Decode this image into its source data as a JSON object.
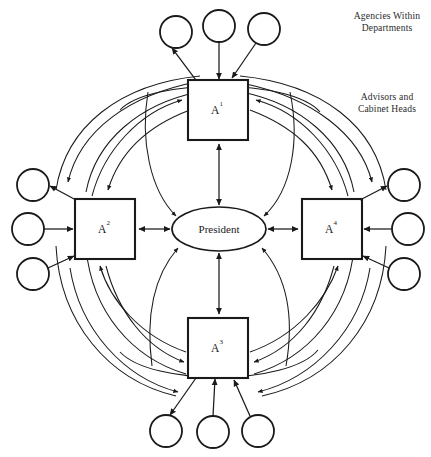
{
  "figure": {
    "background_color": "#ffffff",
    "line_color": "#1a1a1a",
    "width": 431,
    "height": 457
  },
  "center": {
    "name": "president-node",
    "label": "President",
    "shape": "ellipse",
    "cx": 219,
    "cy": 229,
    "rx": 47,
    "ry": 22
  },
  "annotations": {
    "agencies": "Agencies Within\nDepartments",
    "advisors": "Advisors and\nCabinet Heads"
  },
  "departments": [
    {
      "id": "A1",
      "name": "department-box-a1",
      "label_base": "A",
      "label_sup": "1",
      "position": "top",
      "x": 188,
      "y": 80,
      "width": 60,
      "height": 60
    },
    {
      "id": "A2",
      "name": "department-box-a2",
      "label_base": "A",
      "label_sup": "2",
      "position": "left",
      "x": 75,
      "y": 199,
      "width": 60,
      "height": 60
    },
    {
      "id": "A3",
      "name": "department-box-a3",
      "label_base": "A",
      "label_sup": "3",
      "position": "bottom",
      "x": 188,
      "y": 318,
      "width": 60,
      "height": 60
    },
    {
      "id": "A4",
      "name": "department-box-a4",
      "label_base": "A",
      "label_sup": "4",
      "position": "right",
      "x": 302,
      "y": 199,
      "width": 60,
      "height": 60
    }
  ],
  "agency_circles": [
    {
      "id": "top-left",
      "name": "agency-circle-top-left",
      "cx": 176,
      "cy": 32,
      "r": 16
    },
    {
      "id": "top-center",
      "name": "agency-circle-top-center",
      "cx": 219,
      "cy": 26,
      "r": 16
    },
    {
      "id": "top-right",
      "name": "agency-circle-top-right",
      "cx": 264,
      "cy": 29,
      "r": 16
    },
    {
      "id": "left-top",
      "name": "agency-circle-left-top",
      "cx": 33,
      "cy": 185,
      "r": 16
    },
    {
      "id": "left-middle",
      "name": "agency-circle-left-middle",
      "cx": 28,
      "cy": 229,
      "r": 16
    },
    {
      "id": "left-bottom",
      "name": "agency-circle-left-bottom",
      "cx": 33,
      "cy": 274,
      "r": 16
    },
    {
      "id": "right-top",
      "name": "agency-circle-right-top",
      "cx": 404,
      "cy": 185,
      "r": 16
    },
    {
      "id": "right-middle",
      "name": "agency-circle-right-middle",
      "cx": 408,
      "cy": 229,
      "r": 16
    },
    {
      "id": "right-bottom",
      "name": "agency-circle-right-bottom",
      "cx": 404,
      "cy": 274,
      "r": 16
    },
    {
      "id": "bottom-left",
      "name": "agency-circle-bottom-left",
      "cx": 166,
      "cy": 431,
      "r": 16
    },
    {
      "id": "bottom-center",
      "name": "agency-circle-bottom-center",
      "cx": 213,
      "cy": 432,
      "r": 16
    },
    {
      "id": "bottom-right",
      "name": "agency-circle-bottom-right",
      "cx": 258,
      "cy": 431,
      "r": 16
    }
  ],
  "edges": {
    "spokes": [
      {
        "name": "edge-president-a1",
        "from": "president",
        "to": "A1",
        "arrows": "both"
      },
      {
        "name": "edge-president-a2",
        "from": "president",
        "to": "A2",
        "arrows": "both"
      },
      {
        "name": "edge-president-a3",
        "from": "president",
        "to": "A3",
        "arrows": "both"
      },
      {
        "name": "edge-president-a4",
        "from": "president",
        "to": "A4",
        "arrows": "both"
      }
    ],
    "agency_links": [
      {
        "name": "edge-a1-top-left",
        "from": "A1",
        "to": "top-left",
        "arrows": "to"
      },
      {
        "name": "edge-a1-top-center",
        "from": "top-center",
        "to": "A1",
        "arrows": "to"
      },
      {
        "name": "edge-a1-top-right",
        "from": "top-right",
        "to": "A1",
        "arrows": "to"
      },
      {
        "name": "edge-a2-left-top",
        "from": "A2",
        "to": "left-top",
        "arrows": "to"
      },
      {
        "name": "edge-a2-left-middle",
        "from": "left-middle",
        "to": "A2",
        "arrows": "to"
      },
      {
        "name": "edge-a2-left-bottom",
        "from": "left-bottom",
        "to": "A2",
        "arrows": "to"
      },
      {
        "name": "edge-a4-right-top",
        "from": "A4",
        "to": "right-top",
        "arrows": "to"
      },
      {
        "name": "edge-a4-right-middle",
        "from": "right-middle",
        "to": "A4",
        "arrows": "to"
      },
      {
        "name": "edge-a4-right-bottom",
        "from": "right-bottom",
        "to": "A4",
        "arrows": "to"
      },
      {
        "name": "edge-a3-bottom-left",
        "from": "A3",
        "to": "bottom-left",
        "arrows": "to"
      },
      {
        "name": "edge-a3-bottom-center",
        "from": "bottom-center",
        "to": "A3",
        "arrows": "to"
      },
      {
        "name": "edge-a3-bottom-right",
        "from": "bottom-right",
        "to": "A3",
        "arrows": "to"
      }
    ],
    "curved_cross_links_count": 16
  }
}
